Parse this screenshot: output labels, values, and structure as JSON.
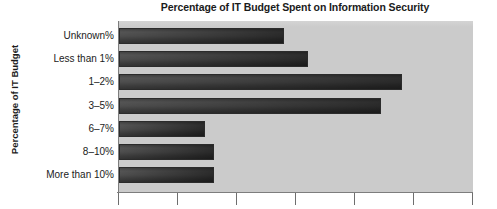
{
  "chart_data": {
    "type": "bar",
    "orientation": "horizontal",
    "title": "Percentage of IT Budget Spent on Information Security",
    "xlabel": "",
    "ylabel": "Percentage of IT Budget",
    "categories": [
      "Unknown%",
      "Less than 1%",
      "1–2%",
      "3–5%",
      "6–7%",
      "8–10%",
      "More than 10%"
    ],
    "values": [
      2.8,
      3.21,
      4.8,
      4.44,
      1.46,
      1.61,
      1.61
    ],
    "xlim": [
      0,
      6
    ],
    "xticks": [
      0,
      1,
      2,
      3,
      4,
      5,
      6
    ],
    "xticklabels": [
      "",
      "",
      "",
      "",
      "",
      "",
      ""
    ],
    "grid": false,
    "legend": null,
    "colors": {
      "plot_background": "#cbcbcb",
      "bar_light": "#9a9a9a",
      "bar_dark": "#4a4a4a",
      "bar_border": "#2b2b2b",
      "axis": "#7d7d7d",
      "text": "#1b1b1b",
      "page_background": "#ffffff"
    }
  },
  "chart": {
    "title": "Percentage of IT Budget Spent on Information Security",
    "y_axis_title": "Percentage of IT Budget",
    "bars": [
      {
        "label": "Unknown%",
        "value": 2.8
      },
      {
        "label": "Less than 1%",
        "value": 3.21
      },
      {
        "label": "1–2%",
        "value": 4.8
      },
      {
        "label": "3–5%",
        "value": 4.44
      },
      {
        "label": "6–7%",
        "value": 1.46
      },
      {
        "label": "8–10%",
        "value": 1.61
      },
      {
        "label": "More than 10%",
        "value": 1.61
      }
    ]
  }
}
